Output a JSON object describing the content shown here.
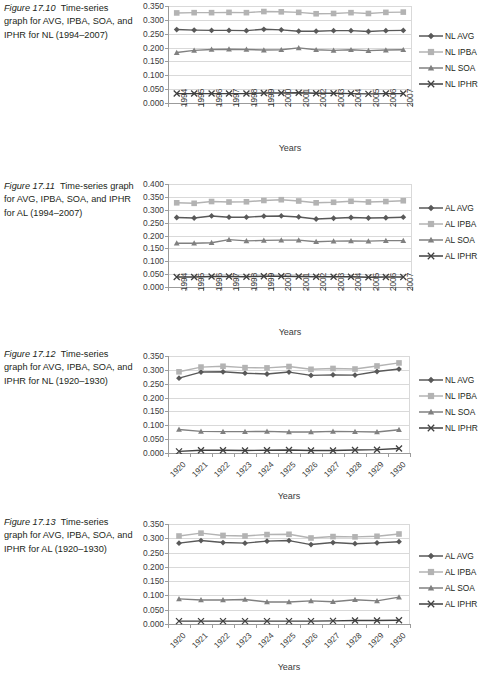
{
  "page": {
    "background": "#ffffff"
  },
  "palette": {
    "avg": "#595959",
    "ipba": "#b3b3b3",
    "soa": "#808080",
    "iphr": "#404040",
    "gridline": "#d9d9d9",
    "axis": "#9b9b9b",
    "text": "#231f20"
  },
  "figures": [
    {
      "id": "fig-17-10",
      "caption_number": "Figure 17.10",
      "caption_text": "Time-series graph for AVG, IPBA, SOA, and IPHR for NL (1994–2007)",
      "xlabels_orientation": "vertical",
      "legend": [
        {
          "label": "NL AVG",
          "marker": "diamond",
          "color": "#595959"
        },
        {
          "label": "NL IPBA",
          "marker": "square",
          "color": "#b3b3b3"
        },
        {
          "label": "NL SOA",
          "marker": "triangle",
          "color": "#808080"
        },
        {
          "label": "NL IPHR",
          "marker": "cross",
          "color": "#404040"
        }
      ],
      "chart_data": {
        "type": "line",
        "title": "",
        "xlabel": "Years",
        "ylabel": "",
        "grid": true,
        "legend_position": "right",
        "ylim": [
          0.0,
          0.35
        ],
        "yticks": [
          "0.000",
          "0.050",
          "0.100",
          "0.150",
          "0.200",
          "0.250",
          "0.300",
          "0.350"
        ],
        "categories": [
          "1994",
          "1995",
          "1996",
          "1997",
          "1998",
          "1999",
          "2000",
          "2001",
          "2002",
          "2003",
          "2004",
          "2005",
          "2006",
          "2007"
        ],
        "series": [
          {
            "name": "NL AVG",
            "values": [
              0.265,
              0.263,
              0.262,
              0.262,
              0.261,
              0.266,
              0.264,
              0.259,
              0.259,
              0.261,
              0.261,
              0.258,
              0.261,
              0.262
            ]
          },
          {
            "name": "NL IPBA",
            "values": [
              0.325,
              0.326,
              0.326,
              0.327,
              0.326,
              0.33,
              0.329,
              0.327,
              0.322,
              0.323,
              0.326,
              0.323,
              0.327,
              0.328
            ]
          },
          {
            "name": "NL SOA",
            "values": [
              0.182,
              0.19,
              0.193,
              0.194,
              0.193,
              0.191,
              0.192,
              0.199,
              0.192,
              0.19,
              0.192,
              0.189,
              0.191,
              0.192
            ]
          },
          {
            "name": "NL IPHR",
            "values": [
              0.034,
              0.034,
              0.034,
              0.034,
              0.034,
              0.036,
              0.036,
              0.037,
              0.035,
              0.035,
              0.034,
              0.033,
              0.034,
              0.034
            ]
          }
        ]
      }
    },
    {
      "id": "fig-17-11",
      "caption_number": "Figure 17.11",
      "caption_text": "Time-series graph for AVG, IPBA, SOA, and IPHR for AL (1994–2007)",
      "xlabels_orientation": "vertical",
      "legend": [
        {
          "label": "AL AVG",
          "marker": "diamond",
          "color": "#595959"
        },
        {
          "label": "AL IPBA",
          "marker": "square",
          "color": "#b3b3b3"
        },
        {
          "label": "AL SOA",
          "marker": "triangle",
          "color": "#808080"
        },
        {
          "label": "AL IPHR",
          "marker": "cross",
          "color": "#404040"
        }
      ],
      "chart_data": {
        "type": "line",
        "title": "",
        "xlabel": "Years",
        "ylabel": "",
        "grid": true,
        "legend_position": "right",
        "ylim": [
          0.0,
          0.4
        ],
        "yticks": [
          "0.000",
          "0.050",
          "0.100",
          "0.150",
          "0.200",
          "0.250",
          "0.300",
          "0.350",
          "0.400"
        ],
        "categories": [
          "1994",
          "1995",
          "1996",
          "1997",
          "1998",
          "1999",
          "2000",
          "2001",
          "2002",
          "2003",
          "2004",
          "2005",
          "2006",
          "2007"
        ],
        "series": [
          {
            "name": "AL AVG",
            "values": [
              0.27,
              0.268,
              0.276,
              0.271,
              0.271,
              0.275,
              0.276,
              0.272,
              0.264,
              0.267,
              0.27,
              0.268,
              0.269,
              0.271
            ]
          },
          {
            "name": "AL IPBA",
            "values": [
              0.327,
              0.325,
              0.332,
              0.33,
              0.331,
              0.336,
              0.339,
              0.334,
              0.327,
              0.329,
              0.333,
              0.33,
              0.332,
              0.335
            ]
          },
          {
            "name": "AL SOA",
            "values": [
              0.17,
              0.17,
              0.172,
              0.184,
              0.179,
              0.181,
              0.182,
              0.182,
              0.176,
              0.178,
              0.179,
              0.178,
              0.18,
              0.18
            ]
          },
          {
            "name": "AL IPHR",
            "values": [
              0.039,
              0.039,
              0.041,
              0.041,
              0.04,
              0.042,
              0.042,
              0.041,
              0.04,
              0.04,
              0.04,
              0.038,
              0.039,
              0.039
            ]
          }
        ]
      }
    },
    {
      "id": "fig-17-12",
      "caption_number": "Figure 17.12",
      "caption_text": "Time-series graph for AVG, IPBA, SOA, and IPHR for NL (1920–1930)",
      "xlabels_orientation": "diagonal",
      "legend": [
        {
          "label": "NL AVG",
          "marker": "diamond",
          "color": "#595959"
        },
        {
          "label": "NL IPBA",
          "marker": "square",
          "color": "#b3b3b3"
        },
        {
          "label": "NL SOA",
          "marker": "triangle",
          "color": "#808080"
        },
        {
          "label": "NL IPHR",
          "marker": "cross",
          "color": "#404040"
        }
      ],
      "chart_data": {
        "type": "line",
        "title": "",
        "xlabel": "Years",
        "ylabel": "",
        "grid": true,
        "legend_position": "right",
        "ylim": [
          0.0,
          0.35
        ],
        "yticks": [
          "0.000",
          "0.050",
          "0.100",
          "0.150",
          "0.200",
          "0.250",
          "0.300",
          "0.350"
        ],
        "categories": [
          "1920",
          "1921",
          "1922",
          "1923",
          "1924",
          "1925",
          "1926",
          "1927",
          "1928",
          "1929",
          "1930"
        ],
        "series": [
          {
            "name": "NL AVG",
            "values": [
              0.27,
              0.292,
              0.293,
              0.288,
              0.285,
              0.292,
              0.28,
              0.282,
              0.281,
              0.294,
              0.303
            ]
          },
          {
            "name": "NL IPBA",
            "values": [
              0.293,
              0.31,
              0.313,
              0.308,
              0.307,
              0.312,
              0.302,
              0.305,
              0.303,
              0.314,
              0.325
            ]
          },
          {
            "name": "NL SOA",
            "values": [
              0.085,
              0.078,
              0.077,
              0.077,
              0.078,
              0.076,
              0.076,
              0.078,
              0.077,
              0.076,
              0.084
            ]
          },
          {
            "name": "NL IPHR",
            "values": [
              0.006,
              0.01,
              0.01,
              0.009,
              0.01,
              0.011,
              0.009,
              0.009,
              0.011,
              0.012,
              0.016
            ]
          }
        ]
      }
    },
    {
      "id": "fig-17-13",
      "caption_number": "Figure 17.13",
      "caption_text": "Time-series graph for AVG, IPBA, SOA, and IPHR for AL (1920–1930)",
      "xlabels_orientation": "diagonal",
      "legend": [
        {
          "label": "AL AVG",
          "marker": "diamond",
          "color": "#595959"
        },
        {
          "label": "AL IPBA",
          "marker": "square",
          "color": "#b3b3b3"
        },
        {
          "label": "AL SOA",
          "marker": "triangle",
          "color": "#808080"
        },
        {
          "label": "AL IPHR",
          "marker": "cross",
          "color": "#404040"
        }
      ],
      "chart_data": {
        "type": "line",
        "title": "",
        "xlabel": "Years",
        "ylabel": "",
        "grid": true,
        "legend_position": "right",
        "ylim": [
          0.0,
          0.35
        ],
        "yticks": [
          "0.000",
          "0.050",
          "0.100",
          "0.150",
          "0.200",
          "0.250",
          "0.300",
          "0.350"
        ],
        "categories": [
          "1920",
          "1921",
          "1922",
          "1923",
          "1924",
          "1925",
          "1926",
          "1927",
          "1928",
          "1929",
          "1930"
        ],
        "series": [
          {
            "name": "AL AVG",
            "values": [
              0.283,
              0.292,
              0.285,
              0.283,
              0.29,
              0.292,
              0.278,
              0.285,
              0.281,
              0.284,
              0.288
            ]
          },
          {
            "name": "AL IPBA",
            "values": [
              0.308,
              0.318,
              0.31,
              0.308,
              0.313,
              0.314,
              0.301,
              0.306,
              0.305,
              0.307,
              0.315
            ]
          },
          {
            "name": "AL SOA",
            "values": [
              0.088,
              0.084,
              0.084,
              0.086,
              0.077,
              0.077,
              0.081,
              0.078,
              0.085,
              0.081,
              0.094
            ]
          },
          {
            "name": "AL IPHR",
            "values": [
              0.01,
              0.01,
              0.01,
              0.01,
              0.01,
              0.01,
              0.01,
              0.011,
              0.012,
              0.012,
              0.013
            ]
          }
        ]
      }
    }
  ]
}
